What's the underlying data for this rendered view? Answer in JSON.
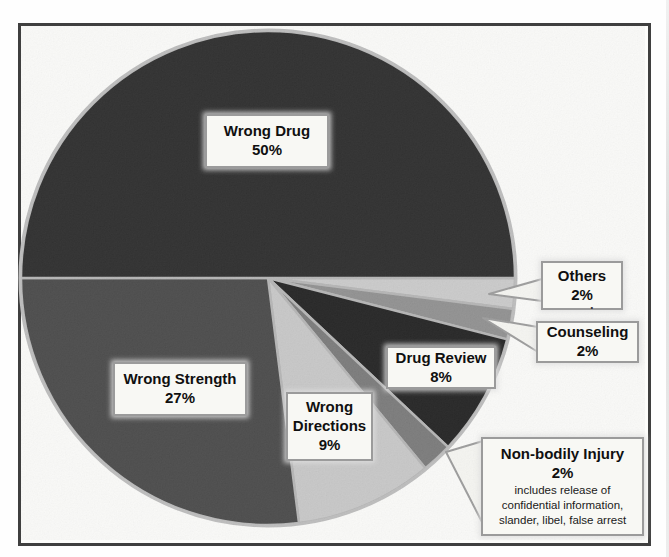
{
  "chart_data": {
    "type": "pie",
    "title": "",
    "legend_position": "none",
    "label_style": "callout-boxes",
    "start_angle_deg_clockwise_from_east": 0,
    "rim_color": "#bdbdbd",
    "box_background": "#f8f8f4",
    "box_border_color": "#9b9b9b",
    "slices": [
      {
        "id": "others",
        "label": "Others",
        "pct_label": "2%",
        "value": 2,
        "color": "#cbcbcb",
        "label_placement": "callout"
      },
      {
        "id": "counseling",
        "label": "Counseling",
        "pct_label": "2%",
        "value": 2,
        "color": "#8f8f8f",
        "label_placement": "callout"
      },
      {
        "id": "drug-review",
        "label": "Drug Review",
        "pct_label": "8%",
        "value": 8,
        "color": "#1e1e1e",
        "label_placement": "inside"
      },
      {
        "id": "non-bodily-injury",
        "label": "Non-bodily Injury",
        "pct_label": "2%",
        "value": 2,
        "color": "#787878",
        "label_placement": "callout",
        "note": "includes release of confidential information, slander, libel, false arrest"
      },
      {
        "id": "wrong-directions",
        "label": "Wrong Directions",
        "pct_label": "9%",
        "value": 9,
        "color": "#c8c8c8",
        "label_placement": "inside"
      },
      {
        "id": "wrong-strength",
        "label": "Wrong Strength",
        "pct_label": "27%",
        "value": 27,
        "color": "#464646",
        "label_placement": "inside"
      },
      {
        "id": "wrong-drug",
        "label": "Wrong Drug",
        "pct_label": "50%",
        "value": 50,
        "color": "#282828",
        "label_placement": "inside"
      }
    ],
    "stray_mark": "."
  }
}
